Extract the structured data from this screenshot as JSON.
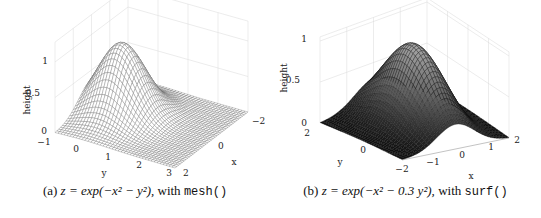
{
  "chart_data": [
    {
      "type": "surface-mesh",
      "function": "z = exp(-x^2 - y^2)",
      "renderer": "mesh()",
      "caption": {
        "label": "(a)",
        "math": "z = exp(−x² − y²), ",
        "with": "with ",
        "code": "mesh()"
      },
      "xlabel": "x",
      "ylabel": "y",
      "zlabel": "height",
      "xlim": [
        -2,
        2
      ],
      "ylim": [
        -1,
        3
      ],
      "zlim": [
        0,
        1
      ],
      "xticks": [
        "-2",
        "0",
        "2"
      ],
      "yticks": [
        "-1",
        "0",
        "1",
        "2",
        "3"
      ],
      "zticks": [
        "0",
        "0.5",
        "1"
      ],
      "grid": true,
      "peak": {
        "x": 0,
        "y": 0,
        "z": 1
      },
      "color": "#ffffff",
      "edge_color": "#555555"
    },
    {
      "type": "surface",
      "function": "z = exp(-x^2 - 0.3 y^2)",
      "renderer": "surf()",
      "caption": {
        "label": "(b)",
        "math": "z = exp(−x² − 0.3 y²), ",
        "with": "with ",
        "code": "surf()"
      },
      "xlabel": "x",
      "ylabel": "y",
      "zlabel": "height",
      "xlim": [
        -2,
        2
      ],
      "ylim": [
        -2,
        2
      ],
      "zlim": [
        0,
        1
      ],
      "xticks": [
        "-2",
        "-1",
        "0",
        "1",
        "2"
      ],
      "yticks": [
        "0",
        "2"
      ],
      "zticks": [
        "0",
        "0.5",
        "1"
      ],
      "grid": true,
      "peak": {
        "x": 0,
        "y": 0,
        "z": 1
      },
      "colormap": "gray",
      "edge_color": "#111111"
    }
  ],
  "ui": {
    "panel_a": {
      "ticks": {
        "z": [
          {
            "t": "1",
            "x": 48,
            "y": 64
          },
          {
            "t": "0.5",
            "x": 40,
            "y": 96
          },
          {
            "t": "0",
            "x": 47,
            "y": 134
          }
        ],
        "y": [
          {
            "t": "−1",
            "x": 44,
            "y": 145
          },
          {
            "t": "0",
            "x": 76,
            "y": 152
          },
          {
            "t": "1",
            "x": 108,
            "y": 160
          },
          {
            "t": "2",
            "x": 139,
            "y": 168
          },
          {
            "t": "3",
            "x": 169,
            "y": 176
          }
        ],
        "x": [
          {
            "t": "−2",
            "x": 252,
            "y": 124
          },
          {
            "t": "0",
            "x": 218,
            "y": 149
          },
          {
            "t": "2",
            "x": 183,
            "y": 176
          }
        ]
      },
      "labels": {
        "z": "height",
        "y": "y",
        "x": "x"
      }
    },
    "panel_b": {
      "ticks": {
        "z": [
          {
            "t": "1",
            "x": 37,
            "y": 42
          },
          {
            "t": "0.5",
            "x": 30,
            "y": 83
          },
          {
            "t": "0",
            "x": 37,
            "y": 126
          }
        ],
        "y": [
          {
            "t": "2",
            "x": 37,
            "y": 136
          },
          {
            "t": "0",
            "x": 93,
            "y": 153
          },
          {
            "t": "−2",
            "x": 132,
            "y": 172
          }
        ],
        "x": [
          {
            "t": "−1",
            "x": 163,
            "y": 165
          },
          {
            "t": "0",
            "x": 192,
            "y": 158
          },
          {
            "t": "1",
            "x": 221,
            "y": 150
          },
          {
            "t": "2",
            "x": 247,
            "y": 143
          }
        ]
      },
      "labels": {
        "z": "height",
        "y": "y",
        "x": "x"
      }
    }
  }
}
